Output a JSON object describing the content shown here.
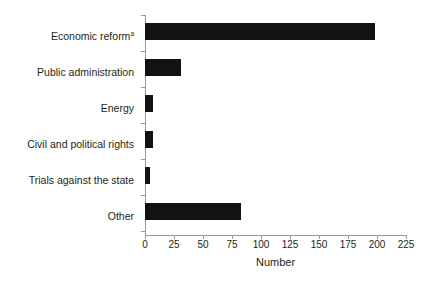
{
  "chart_data": {
    "type": "bar",
    "orientation": "horizontal",
    "title": "",
    "subtitle": "",
    "xlabel": "Number",
    "ylabel": "",
    "categories": [
      "Economic reform",
      "Public administration",
      "Energy",
      "Civil and political rights",
      "Trials against the state",
      "Other"
    ],
    "category_superscripts": [
      "a",
      "",
      "",
      "",
      "",
      ""
    ],
    "values": [
      198,
      31,
      7,
      7,
      4,
      83
    ],
    "xlim": [
      0,
      225
    ],
    "xticks": [
      0,
      25,
      50,
      75,
      100,
      125,
      150,
      175,
      200,
      225
    ],
    "xticklabels": [
      "0",
      "25",
      "50",
      "75",
      "100",
      "125",
      "150",
      "175",
      "200",
      "225"
    ],
    "grid": false,
    "legend": null,
    "bar_color": "#121212",
    "axis_color": "#9a9a9a",
    "background_color": "#ffffff",
    "text_color": "#231f20"
  },
  "axis": {
    "x_title": "Number"
  }
}
